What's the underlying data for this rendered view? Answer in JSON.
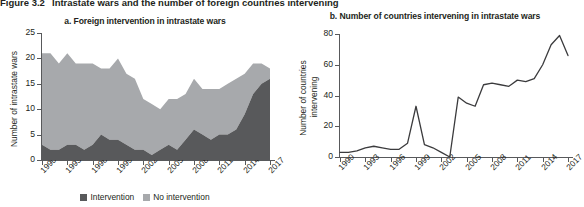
{
  "figure": {
    "number": "Figure 3.2",
    "caption": "Intrastate wars and the number of foreign countries intervening"
  },
  "colors": {
    "intervention": "#58595b",
    "no_intervention": "#a7a9ac",
    "axis": "#58595b",
    "line": "#3b3b3d",
    "text": "#231f20"
  },
  "panel_a": {
    "title": "a. Foreign intervention in intrastate wars",
    "legend": [
      {
        "label": "Intervention",
        "color": "#58595b"
      },
      {
        "label": "No intervention",
        "color": "#a7a9ac"
      }
    ]
  },
  "panel_b": {
    "title": "b. Number of countries intervening in intrastate wars",
    "ylabel_line1": "Number of countries",
    "ylabel_line2": "intervening"
  },
  "chart_data": [
    {
      "type": "area",
      "id": "panel-a",
      "title": "a. Foreign intervention in intrastate wars",
      "xlabel": "",
      "ylabel": "Number of intrastate wars",
      "stacked": true,
      "grid": false,
      "legend_position": "bottom",
      "xlim": [
        1990,
        2017
      ],
      "ylim": [
        0,
        25
      ],
      "yticks": [
        0,
        5,
        10,
        15,
        20,
        25
      ],
      "xticks": [
        1990,
        1993,
        1996,
        1999,
        2002,
        2005,
        2008,
        2011,
        2014,
        2017
      ],
      "x": [
        1990,
        1991,
        1992,
        1993,
        1994,
        1995,
        1996,
        1997,
        1998,
        1999,
        2000,
        2001,
        2002,
        2003,
        2004,
        2005,
        2006,
        2007,
        2008,
        2009,
        2010,
        2011,
        2012,
        2013,
        2014,
        2015,
        2016,
        2017
      ],
      "series": [
        {
          "name": "Intervention",
          "color": "#58595b",
          "values": [
            3,
            2,
            2,
            3,
            3,
            2,
            3,
            5,
            4,
            4,
            3,
            2,
            2,
            1,
            2,
            3,
            2,
            4,
            6,
            5,
            4,
            5,
            5,
            6,
            9,
            13,
            15,
            16
          ]
        },
        {
          "name": "No intervention",
          "color": "#a7a9ac",
          "values": [
            18,
            19,
            17,
            18,
            16,
            17,
            16,
            13,
            14,
            16,
            14,
            14,
            10,
            10,
            8,
            9,
            10,
            9,
            10,
            9,
            10,
            9,
            10,
            10,
            8,
            6,
            4,
            2
          ]
        }
      ],
      "totals": [
        21,
        21,
        19,
        21,
        19,
        19,
        19,
        18,
        18,
        20,
        17,
        16,
        12,
        11,
        10,
        12,
        12,
        13,
        16,
        14,
        14,
        14,
        15,
        16,
        17,
        19,
        19,
        18
      ]
    },
    {
      "type": "line",
      "id": "panel-b",
      "title": "b. Number of countries intervening in intrastate wars",
      "xlabel": "",
      "ylabel": "Number of countries intervening",
      "grid": false,
      "legend_position": "none",
      "xlim": [
        1990,
        2017
      ],
      "ylim": [
        0,
        80
      ],
      "yticks": [
        0,
        20,
        40,
        60,
        80
      ],
      "xticks": [
        1990,
        1993,
        1996,
        1999,
        2002,
        2005,
        2008,
        2011,
        2014,
        2017
      ],
      "x": [
        1990,
        1991,
        1992,
        1993,
        1994,
        1995,
        1996,
        1997,
        1998,
        1999,
        2000,
        2001,
        2002,
        2003,
        2004,
        2005,
        2006,
        2007,
        2008,
        2009,
        2010,
        2011,
        2012,
        2013,
        2014,
        2015,
        2016,
        2017
      ],
      "values": [
        3,
        3,
        4,
        6,
        7,
        6,
        5,
        5,
        9,
        33,
        8,
        6,
        3,
        0,
        39,
        35,
        33,
        47,
        48,
        47,
        46,
        50,
        49,
        51,
        60,
        73,
        79,
        66,
        65
      ]
    }
  ]
}
